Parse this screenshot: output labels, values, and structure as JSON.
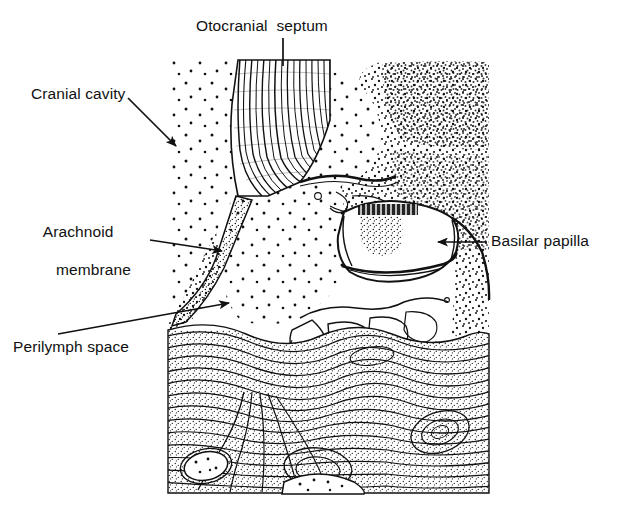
{
  "figure": {
    "kind": "anatomical-line-drawing",
    "background_color": "#ffffff",
    "ink_color": "#111111"
  },
  "labels": {
    "septum": "Otocranial  septum",
    "cranial_cavity": "Cranial cavity",
    "arachnoid_line1": "Arachnoid",
    "arachnoid_line2": "membrane",
    "perilymph": "Perilymph space",
    "basilar": "Basilar papilla"
  },
  "leaders": [
    {
      "name": "septum-leader",
      "type": "plain-line",
      "from": [
        283,
        38
      ],
      "to": [
        283,
        66
      ]
    },
    {
      "name": "cranial-leader",
      "type": "arrow",
      "from": [
        128,
        98
      ],
      "to": [
        176,
        146
      ]
    },
    {
      "name": "arachnoid-leader",
      "type": "arrow",
      "from": [
        150,
        240
      ],
      "to": [
        222,
        251
      ]
    },
    {
      "name": "perilymph-leader",
      "type": "arrow",
      "from": [
        58,
        334
      ],
      "to": [
        229,
        303
      ]
    },
    {
      "name": "basilar-leader",
      "type": "arrow",
      "from": [
        487,
        242
      ],
      "to": [
        438,
        242
      ]
    }
  ],
  "regions": [
    {
      "name": "cranial-cavity",
      "fill": "sparse-stipple"
    },
    {
      "name": "otocranial-septum",
      "fill": "dense-fibre-striation"
    },
    {
      "name": "arachnoid-membrane",
      "fill": "fine-stipple-band"
    },
    {
      "name": "perilymph-space",
      "fill": "sparse-stipple"
    },
    {
      "name": "periotic-tissue",
      "fill": "medium-stipple"
    },
    {
      "name": "basilar-papilla",
      "fill": "clear-lumen-with-hair-cells"
    },
    {
      "name": "lamellar-bone",
      "fill": "concentric-lamellae"
    }
  ]
}
